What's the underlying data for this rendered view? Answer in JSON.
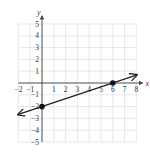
{
  "chart_data": {
    "type": "line",
    "title": "",
    "xlabel": "x",
    "ylabel": "y",
    "xlim": [
      -2,
      8
    ],
    "ylim": [
      -5,
      5
    ],
    "grid": true,
    "x_ticks": [
      "-2",
      "-1",
      "1",
      "2",
      "3",
      "4",
      "5",
      "6",
      "7",
      "8"
    ],
    "y_ticks": [
      "5",
      "4",
      "3",
      "2",
      "1",
      "-1",
      "-2",
      "-3",
      "-4",
      "-5"
    ],
    "series": [
      {
        "name": "line",
        "equation": "y = (1/3)x - 2",
        "x": [
          -2,
          8
        ],
        "y": [
          -2.667,
          0.667
        ],
        "arrows": "both"
      }
    ],
    "points": [
      {
        "x": 0,
        "y": -2
      },
      {
        "x": 6,
        "y": 0
      }
    ]
  },
  "labels": {
    "x_axis": "x",
    "y_axis": "y"
  }
}
